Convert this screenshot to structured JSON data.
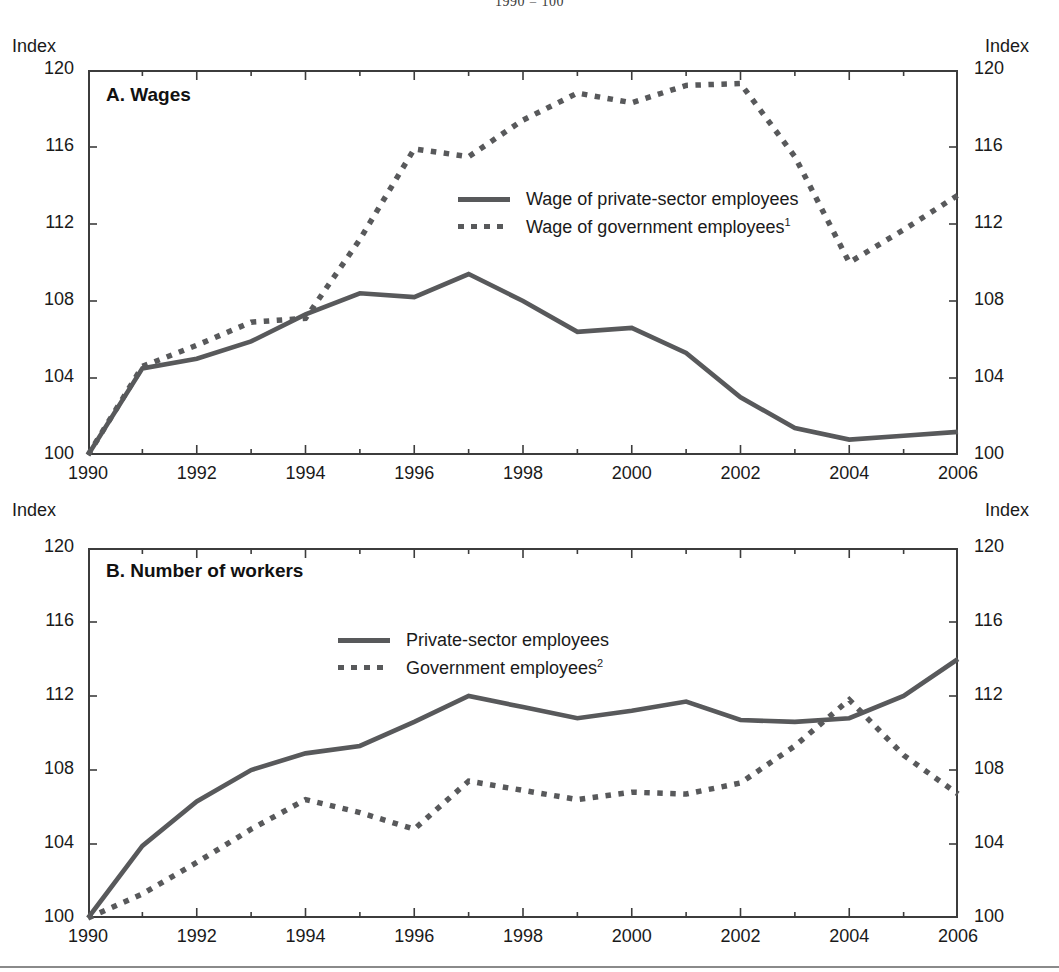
{
  "figure": {
    "supertitle": "1990 = 100",
    "axis_name_left": "Index",
    "axis_name_right": "Index",
    "line_color": "#58595b",
    "frame_color": "#3c3c3c"
  },
  "panels": {
    "a": {
      "title": "A. Wages",
      "legend": [
        {
          "style": "solid",
          "label": "Wage of private-sector employees",
          "note": ""
        },
        {
          "style": "dotted",
          "label": "Wage of government employees",
          "note": "1"
        }
      ]
    },
    "b": {
      "title": "B. Number of workers",
      "legend": [
        {
          "style": "solid",
          "label": "Private-sector employees",
          "note": ""
        },
        {
          "style": "dotted",
          "label": "Government employees",
          "note": "2"
        }
      ]
    }
  },
  "axes": {
    "y_ticks": [
      100,
      104,
      108,
      112,
      116,
      120
    ],
    "y_tick_labels": [
      "100",
      "104",
      "108",
      "112",
      "116",
      "120"
    ],
    "ylim": [
      100,
      120
    ],
    "x_ticks": [
      1990,
      1992,
      1994,
      1996,
      1998,
      2000,
      2002,
      2004,
      2006
    ],
    "x_tick_labels": [
      "1990",
      "1992",
      "1994",
      "1996",
      "1998",
      "2000",
      "2002",
      "2004",
      "2006"
    ],
    "xlim": [
      1990,
      2006
    ],
    "x_minor_step": 1,
    "grid": false
  },
  "chart_data": [
    {
      "type": "line",
      "panel": "A",
      "title": "A. Wages",
      "subtitle": "1990 = 100",
      "xlabel": "",
      "ylabel": "Index",
      "xlim": [
        1990,
        2006
      ],
      "ylim": [
        100,
        120
      ],
      "legend_position": "center",
      "grid": false,
      "x": [
        1990,
        1991,
        1992,
        1993,
        1994,
        1995,
        1996,
        1997,
        1998,
        1999,
        2000,
        2001,
        2002,
        2003,
        2004,
        2005,
        2006
      ],
      "series": [
        {
          "name": "Wage of private-sector employees",
          "style": "solid",
          "values": [
            100.0,
            104.5,
            105.0,
            105.9,
            107.3,
            108.4,
            108.2,
            109.4,
            108.0,
            106.4,
            106.6,
            105.3,
            103.0,
            101.4,
            100.8,
            101.0,
            101.2
          ]
        },
        {
          "name": "Wage of government employees",
          "style": "dotted",
          "note": "1",
          "values": [
            100.0,
            104.6,
            105.7,
            106.9,
            107.1,
            111.2,
            115.9,
            115.5,
            117.4,
            118.8,
            118.3,
            119.2,
            119.3,
            115.5,
            110.0,
            111.7,
            113.5
          ]
        }
      ]
    },
    {
      "type": "line",
      "panel": "B",
      "title": "B. Number of workers",
      "subtitle": "1990 = 100",
      "xlabel": "",
      "ylabel": "Index",
      "xlim": [
        1990,
        2006
      ],
      "ylim": [
        100,
        120
      ],
      "legend_position": "center",
      "grid": false,
      "x": [
        1990,
        1991,
        1992,
        1993,
        1994,
        1995,
        1996,
        1997,
        1998,
        1999,
        2000,
        2001,
        2002,
        2003,
        2004,
        2005,
        2006
      ],
      "series": [
        {
          "name": "Private-sector employees",
          "style": "solid",
          "values": [
            100.0,
            103.9,
            106.3,
            108.0,
            108.9,
            109.3,
            110.6,
            112.0,
            111.4,
            110.8,
            111.2,
            111.7,
            110.7,
            110.6,
            110.8,
            112.0,
            114.0
          ]
        },
        {
          "name": "Government employees",
          "style": "dotted",
          "note": "2",
          "values": [
            100.0,
            101.3,
            103.0,
            104.8,
            106.4,
            105.7,
            104.8,
            107.4,
            106.9,
            106.4,
            106.8,
            106.7,
            107.3,
            109.3,
            111.8,
            108.8,
            106.7
          ]
        }
      ]
    }
  ]
}
